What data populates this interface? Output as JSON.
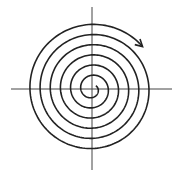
{
  "diagram": {
    "type": "spiral",
    "center": [
      92,
      89
    ],
    "axes": {
      "horizontal": {
        "x1": 11,
        "x2": 172,
        "y": 89
      },
      "vertical": {
        "x": 92,
        "y1": 7,
        "y2": 170
      }
    },
    "spiral": {
      "turns": 6,
      "inner_radius": 5,
      "outer_radius": 66,
      "direction": "clockwise",
      "arrow": "arrow-head-icon"
    },
    "colors": {
      "stroke": "#222222",
      "axis": "#444444",
      "background": "#ffffff"
    }
  }
}
